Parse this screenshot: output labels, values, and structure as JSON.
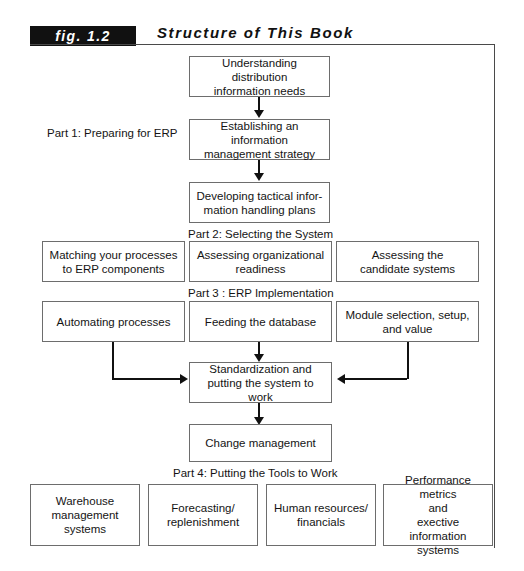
{
  "figure": {
    "tag": "fig. 1.2",
    "title": "Structure of This Book"
  },
  "part_labels": {
    "part1": "Part 1: Preparing for ERP",
    "part2": "Part 2: Selecting the System",
    "part3": "Part 3 : ERP Implementation",
    "part4": "Part 4: Putting the Tools to Work"
  },
  "boxes": {
    "understanding_needs": "Understanding distribution information needs",
    "establishing_strategy": "Establishing an information management strategy",
    "developing_plans": "Developing tactical infor- mation handling plans",
    "matching_processes": "Matching your processes to ERP components",
    "assessing_readiness": "Assessing organizational readiness",
    "assessing_candidates": "Assessing the candidate systems",
    "automating_processes": "Automating processes",
    "feeding_database": "Feeding the database",
    "module_selection": "Module selection, setup, and value",
    "standardization": "Standardization and putting the system to work",
    "change_management": "Change management",
    "warehouse": "Warehouse management systems",
    "forecasting": "Forecasting/ replenishment",
    "human_resources": "Human resources/ financials",
    "performance_metrics": "Performance metrics and exective information systems"
  },
  "box_lines": {
    "understanding_needs": [
      "Understanding distribution",
      "information needs"
    ],
    "establishing_strategy": [
      "Establishing an information",
      "management strategy"
    ],
    "developing_plans": [
      "Developing tactical infor-",
      "mation handling plans"
    ],
    "matching_processes": [
      "Matching your processes",
      "to ERP components"
    ],
    "assessing_readiness": [
      "Assessing organizational",
      "readiness"
    ],
    "assessing_candidates": [
      "Assessing the",
      "candidate systems"
    ],
    "automating_processes": [
      "Automating processes"
    ],
    "feeding_database": [
      "Feeding the database"
    ],
    "module_selection": [
      "Module selection, setup,",
      "and value"
    ],
    "standardization": [
      "Standardization and",
      "putting the system to work"
    ],
    "change_management": [
      "Change management"
    ],
    "warehouse": [
      "Warehouse",
      "management systems"
    ],
    "forecasting": [
      "Forecasting/",
      "replenishment"
    ],
    "human_resources": [
      "Human resources/",
      "financials"
    ],
    "performance_metrics": [
      "Performance metrics",
      "and",
      "exective information",
      "systems"
    ]
  },
  "colors": {
    "tag_background": "#111111",
    "tag_text": "#ffffff",
    "box_border": "#6d6d6d",
    "frame_border": "#4a4a4a",
    "connector": "#111111",
    "text": "#141414"
  }
}
